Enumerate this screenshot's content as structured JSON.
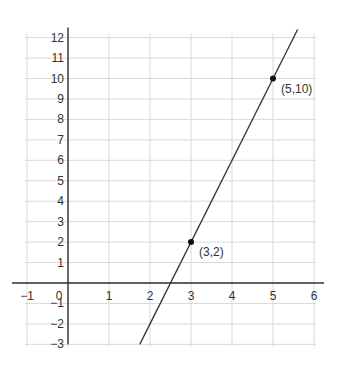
{
  "chart_data": {
    "type": "line",
    "title": "",
    "xlabel": "",
    "ylabel": "",
    "xlim": [
      -1,
      6
    ],
    "ylim": [
      -3,
      12
    ],
    "grid": true,
    "x_ticks": [
      "−1",
      "0",
      "1",
      "2",
      "3",
      "4",
      "5",
      "6"
    ],
    "y_ticks": [
      "12",
      "11",
      "10",
      "9",
      "8",
      "7",
      "6",
      "5",
      "4",
      "3",
      "2",
      "1",
      "−1",
      "−2",
      "−3"
    ],
    "series": [
      {
        "name": "line through (3,2) and (5,10)",
        "equation": "y = 4x - 10",
        "x": [
          1.75,
          5.6
        ],
        "y": [
          -3,
          12.4
        ]
      }
    ],
    "points": [
      {
        "x": 3,
        "y": 2,
        "label": "(3,2)"
      },
      {
        "x": 5,
        "y": 10,
        "label": "(5,10)"
      }
    ],
    "colors": {
      "grid": "#d9d9d9",
      "axis": "#333333",
      "line": "#333333",
      "point": "#111111"
    }
  }
}
